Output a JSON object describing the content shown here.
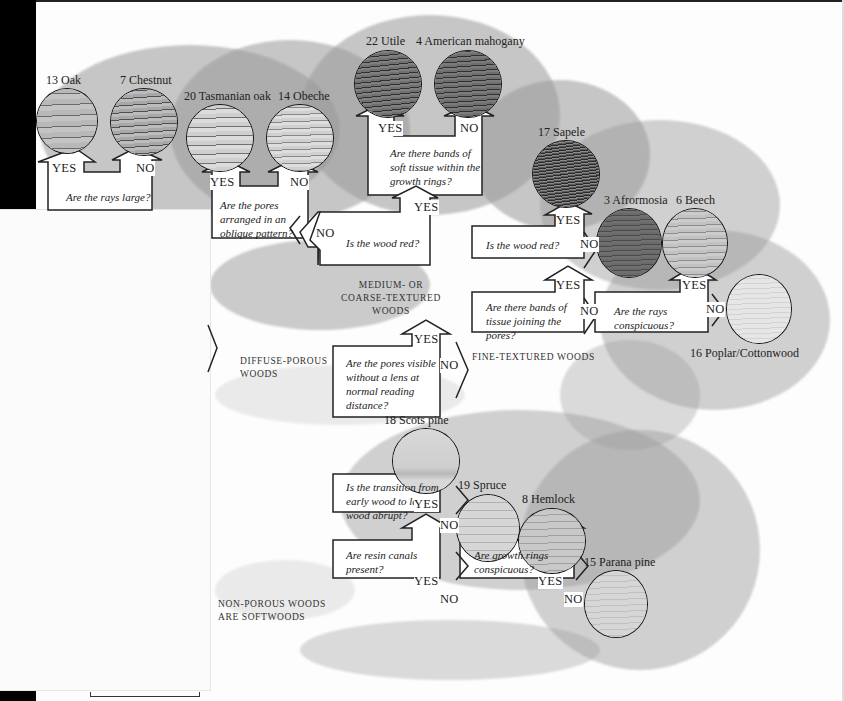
{
  "woods": [
    {
      "id": "oak",
      "number": "13",
      "name": "Oak",
      "tone": "#b5b5b5",
      "dark": "#555"
    },
    {
      "id": "chestnut",
      "number": "7",
      "name": "Chestnut",
      "tone": "#a9a9a9",
      "dark": "#444"
    },
    {
      "id": "tasmanian-oak",
      "number": "20",
      "name": "Tasmanian oak",
      "tone": "#c4c4c4",
      "dark": "#666"
    },
    {
      "id": "obeche",
      "number": "14",
      "name": "Obeche",
      "tone": "#c8c8c8",
      "dark": "#777"
    },
    {
      "id": "utile",
      "number": "22",
      "name": "Utile",
      "tone": "#6f6f6f",
      "dark": "#2a2a2a"
    },
    {
      "id": "american-mahogany",
      "number": "4",
      "name": "American mahogany",
      "tone": "#727272",
      "dark": "#2d2d2d"
    },
    {
      "id": "sapele",
      "number": "17",
      "name": "Sapele",
      "tone": "#5e5e5e",
      "dark": "#222"
    },
    {
      "id": "afrormosia",
      "number": "3",
      "name": "Afrormosia",
      "tone": "#6a6a6a",
      "dark": "#3a3a3a"
    },
    {
      "id": "beech",
      "number": "6",
      "name": "Beech",
      "tone": "#bdbdbd",
      "dark": "#6b6b6b"
    },
    {
      "id": "poplar-cottonwood",
      "number": "16",
      "name": "Poplar/Cottonwood",
      "tone": "#e3e3e3",
      "dark": "#c8c8c8"
    },
    {
      "id": "scots-pine",
      "number": "18",
      "name": "Scots pine",
      "tone": "#d6d6d6",
      "dark": "#a8a8a8"
    },
    {
      "id": "spruce",
      "number": "19",
      "name": "Spruce",
      "tone": "#d2d2d2",
      "dark": "#a5a5a5"
    },
    {
      "id": "hemlock",
      "number": "8",
      "name": "Hemlock",
      "tone": "#c6c6c6",
      "dark": "#979797"
    },
    {
      "id": "parana-pine",
      "number": "15",
      "name": "Parana pine",
      "tone": "#d3d3d3",
      "dark": "#b0b0b0"
    }
  ],
  "questions": {
    "rays_large": "Are the rays large?",
    "pores_oblique": "Are the pores arranged in an oblique pattern?",
    "bands_soft_tissue": "Are there bands of soft tissue within the growth rings?",
    "wood_red_medium": "Is the wood red?",
    "wood_red_fine": "Is the wood red?",
    "bands_joining_pores": "Are there bands of tissue joining the pores?",
    "rays_conspicuous": "Are the rays conspicuous?",
    "pores_visible": "Are the pores visible without a lens at normal reading distance?",
    "transition_abrupt": "Is the transition from early wood to late wood abrupt?",
    "resin_canals": "Are resin canals present?",
    "growth_rings": "Are growth rings conspicuous?"
  },
  "answers": {
    "yes": "YES",
    "no": "NO"
  },
  "categories": {
    "medium_coarse": "MEDIUM- OR COARSE-TEXTURED WOODS",
    "fine": "FINE-TEXTURED WOODS",
    "diffuse_porous": "DIFFUSE-POROUS WOODS",
    "non_porous": "NON-POROUS WOODS ARE SOFTWOODS"
  },
  "colors": {
    "ink": "#1a1a1a",
    "foliage": "#9a9a9a",
    "paper": "#fdfdfd",
    "edge": "#000000"
  }
}
